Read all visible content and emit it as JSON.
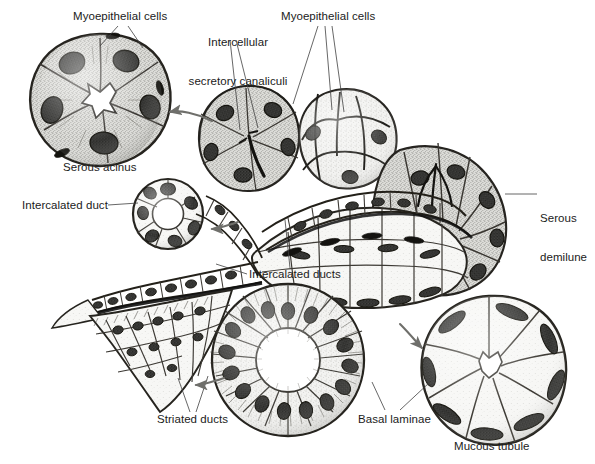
{
  "figure": {
    "background_color": "#ffffff",
    "ink_color": "#1b1b1b",
    "style": "black-and-white stippled anatomical line drawing"
  },
  "labels": [
    {
      "id": "myoepithelial-cells-left",
      "text": "Myoepithelial cells",
      "lines": [
        "Myoepithelial cells"
      ],
      "x": 73,
      "y": 10,
      "align": "left",
      "leaders": [
        {
          "from": [
            118,
            26
          ],
          "to": [
            100,
            46
          ]
        },
        {
          "from": [
            128,
            26
          ],
          "to": [
            143,
            48
          ]
        }
      ]
    },
    {
      "id": "intercellular-secretory-canaliculi",
      "text": "Intercellular secretory canaliculi",
      "lines": [
        "Intercellular",
        "secretory canaliculi"
      ],
      "x": 182,
      "y": 10,
      "align": "center",
      "leaders": [
        {
          "from": [
            230,
            40
          ],
          "to": [
            240,
            130
          ]
        },
        {
          "from": [
            236,
            40
          ],
          "to": [
            258,
            128
          ]
        }
      ]
    },
    {
      "id": "myoepithelial-cells-right",
      "text": "Myoepithelial cells",
      "lines": [
        "Myoepithelial cells"
      ],
      "x": 281,
      "y": 10,
      "align": "left",
      "leaders": [
        {
          "from": [
            318,
            26
          ],
          "to": [
            293,
            104
          ]
        },
        {
          "from": [
            325,
            26
          ],
          "to": [
            332,
            110
          ]
        },
        {
          "from": [
            332,
            26
          ],
          "to": [
            344,
            112
          ]
        }
      ]
    },
    {
      "id": "serous-acinus",
      "text": "Serous acinus",
      "lines": [
        "Serous acinus"
      ],
      "x": 63,
      "y": 161,
      "align": "left",
      "leaders": []
    },
    {
      "id": "serous-demilune",
      "text": "Serous demilune",
      "lines": [
        "Serous",
        "demilune"
      ],
      "x": 540,
      "y": 186,
      "align": "left",
      "leaders": [
        {
          "from": [
            537,
            194
          ],
          "to": [
            505,
            194
          ]
        }
      ]
    },
    {
      "id": "intercalated-duct",
      "text": "Intercalated duct",
      "lines": [
        "Intercalated duct"
      ],
      "x": 22,
      "y": 199,
      "align": "left",
      "leaders": [
        {
          "from": [
            108,
            205
          ],
          "to": [
            138,
            203
          ]
        }
      ]
    },
    {
      "id": "intercalated-ducts",
      "text": "Intercalated ducts",
      "lines": [
        "Intercalated ducts"
      ],
      "x": 249,
      "y": 268,
      "align": "left",
      "leaders": [
        {
          "from": [
            247,
            274
          ],
          "to": [
            216,
            264
          ]
        },
        {
          "from": [
            290,
            268
          ],
          "to": [
            285,
            220
          ]
        }
      ]
    },
    {
      "id": "striated-ducts",
      "text": "Striated ducts",
      "lines": [
        "Striated ducts"
      ],
      "x": 157,
      "y": 413,
      "align": "left",
      "leaders": [
        {
          "from": [
            190,
            412
          ],
          "to": [
            178,
            378
          ]
        },
        {
          "from": [
            196,
            412
          ],
          "to": [
            208,
            376
          ]
        }
      ]
    },
    {
      "id": "basal-laminae",
      "text": "Basal laminae",
      "lines": [
        "Basal laminae"
      ],
      "x": 358,
      "y": 413,
      "align": "left",
      "leaders": [
        {
          "from": [
            385,
            410
          ],
          "to": [
            372,
            382
          ]
        },
        {
          "from": [
            400,
            410
          ],
          "to": [
            430,
            382
          ]
        }
      ]
    },
    {
      "id": "mucous-tubule",
      "text": "Mucous tubule",
      "lines": [
        "Mucous tubule"
      ],
      "x": 454,
      "y": 440,
      "align": "left",
      "leaders": []
    }
  ],
  "structures": [
    {
      "id": "serous-acinus-cross-section",
      "name": "Serous acinus cross-section",
      "center": [
        100,
        100
      ],
      "radius": 66,
      "cell_count": 6
    },
    {
      "id": "intercalated-duct-cross-section",
      "name": "Intercalated duct cross-section",
      "center": [
        168,
        214
      ],
      "radius": 36,
      "cell_count": 7
    },
    {
      "id": "striated-duct-cross-section",
      "name": "Striated duct cross-section",
      "center": [
        288,
        360
      ],
      "radius": 77,
      "cell_count": 20
    },
    {
      "id": "mucous-tubule-cross-section",
      "name": "Mucous tubule cross-section",
      "center": [
        489,
        370
      ],
      "radius": 74,
      "cell_count": 8
    },
    {
      "id": "secretory-unit-3d",
      "name": "Three-dimensional secretory unit with acini, demilunes and duct system",
      "center": [
        345,
        190
      ]
    }
  ],
  "arrows": [
    {
      "id": "arrow-to-serous-acinus",
      "from": [
        212,
        121
      ],
      "to": [
        166,
        113
      ]
    },
    {
      "id": "arrow-to-intercalated-duct",
      "from": [
        238,
        222
      ],
      "to": [
        208,
        229
      ]
    },
    {
      "id": "arrow-to-striated-duct",
      "from": [
        224,
        378
      ],
      "to": [
        192,
        385
      ]
    },
    {
      "id": "arrow-to-mucous-tubule",
      "from": [
        400,
        324
      ],
      "to": [
        425,
        351
      ]
    }
  ]
}
